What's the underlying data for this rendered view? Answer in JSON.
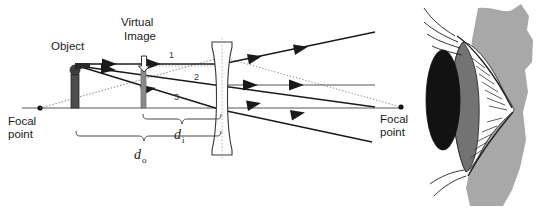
{
  "figure": {
    "type": "optics-ray-diagram",
    "background_color": "#ffffff",
    "line_color": "#1a1a1a",
    "axis_color": "#555555",
    "object_color": "#4d4d4d",
    "image_color": "#808080",
    "skin_color": "#a8a8a8",
    "iris_color": "#737373",
    "pupil_color": "#111111",
    "sclera_color": "#ffffff"
  },
  "labels": {
    "object": "Object",
    "virtual_image_line1": "Virtual",
    "virtual_image_line2": "Image",
    "focal_point_left_line1": "Focal",
    "focal_point_left_line2": "point",
    "focal_point_right_line1": "Focal",
    "focal_point_right_line2": "point",
    "ray_1": "1",
    "ray_2": "2",
    "ray_3": "3",
    "distance_image_var": "d",
    "distance_image_sub": "i",
    "distance_object_var": "d",
    "distance_object_sub": "o"
  },
  "geometry": {
    "axis_y": 108,
    "axis_x_start": 22,
    "axis_x_end": 402,
    "focal_left_x": 40,
    "focal_right_x": 401,
    "object_x": 76,
    "object_top_y": 64,
    "image_x": 143,
    "image_top_y": 62,
    "lens_x": 222,
    "lens_top_y": 40,
    "lens_bottom_y": 155
  },
  "rays": [
    {
      "id": "1",
      "kind": "parallel-then-diverge",
      "label_x": 172,
      "label_y": 57
    },
    {
      "id": "2",
      "kind": "through-center",
      "label_x": 196,
      "label_y": 78
    },
    {
      "id": "3",
      "kind": "toward-far-focal",
      "label_x": 176,
      "label_y": 99
    }
  ]
}
